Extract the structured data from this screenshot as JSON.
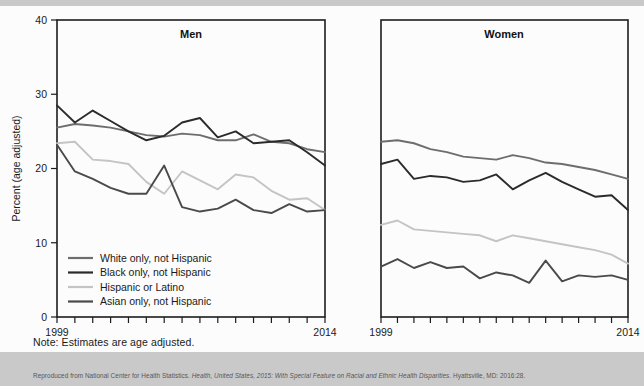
{
  "figure": {
    "note": "Note: Estimates are age adjusted.",
    "citation_prefix": "Reproduced from National Center for Health Statistics. ",
    "citation_italic": "Health, United States, 2015: With Special Feature on Racial and Ethnic Health Disparities",
    "citation_suffix": ". Hyattsville, MD: 2016:28."
  },
  "chart_data": {
    "type": "line",
    "title": "",
    "ylabel": "Percent (age adjusted)",
    "xlabel": "",
    "ylim": [
      0,
      40
    ],
    "yticks": [
      0,
      10,
      20,
      30,
      40
    ],
    "ytick_labels": [
      "0",
      "10",
      "20",
      "30",
      "40"
    ],
    "xlim": [
      1999,
      2014
    ],
    "x": [
      1999,
      2000,
      2001,
      2002,
      2003,
      2004,
      2005,
      2006,
      2007,
      2008,
      2009,
      2010,
      2011,
      2012,
      2013,
      2014
    ],
    "xtick_labels_shown": [
      "1999",
      "2014"
    ],
    "grid": false,
    "legend_position": "lower-left-inside-men-panel",
    "panels": [
      {
        "label": "Men",
        "series": [
          {
            "name": "White only, not Hispanic",
            "color": "#6d6d6d",
            "values": [
              25.5,
              26.0,
              25.8,
              25.5,
              25.0,
              24.5,
              24.3,
              24.7,
              24.5,
              23.8,
              23.8,
              24.6,
              23.6,
              23.4,
              22.6,
              22.2
            ]
          },
          {
            "name": "Black only, not Hispanic",
            "color": "#2b2b2b",
            "values": [
              28.5,
              26.2,
              27.8,
              26.4,
              25.0,
              23.8,
              24.4,
              26.2,
              26.8,
              24.2,
              25.0,
              23.4,
              23.6,
              23.8,
              22.2,
              20.4
            ]
          },
          {
            "name": "Hispanic or Latino",
            "color": "#c4c4c4",
            "values": [
              23.4,
              23.6,
              21.2,
              21.0,
              20.6,
              18.2,
              16.6,
              19.6,
              18.4,
              17.2,
              19.2,
              18.8,
              17.0,
              15.8,
              16.0,
              14.4
            ]
          },
          {
            "name": "Asian only, not Hispanic",
            "color": "#4a4a4a",
            "values": [
              23.2,
              19.6,
              18.6,
              17.4,
              16.6,
              16.6,
              20.4,
              14.8,
              14.2,
              14.6,
              15.8,
              14.4,
              14.0,
              15.2,
              14.2,
              14.4
            ]
          }
        ]
      },
      {
        "label": "Women",
        "series": [
          {
            "name": "White only, not Hispanic",
            "color": "#6d6d6d",
            "values": [
              23.6,
              23.8,
              23.4,
              22.6,
              22.2,
              21.6,
              21.4,
              21.2,
              21.8,
              21.4,
              20.8,
              20.6,
              20.2,
              19.8,
              19.2,
              18.6
            ]
          },
          {
            "name": "Black only, not Hispanic",
            "color": "#2b2b2b",
            "values": [
              20.6,
              21.2,
              18.6,
              19.0,
              18.8,
              18.2,
              18.4,
              19.2,
              17.2,
              18.4,
              19.4,
              18.2,
              17.2,
              16.2,
              16.4,
              14.4
            ]
          },
          {
            "name": "Hispanic or Latino",
            "color": "#c4c4c4",
            "values": [
              12.4,
              13.0,
              11.8,
              11.6,
              11.4,
              11.2,
              11.0,
              10.2,
              11.0,
              10.6,
              10.2,
              9.8,
              9.4,
              9.0,
              8.4,
              7.2
            ]
          },
          {
            "name": "Asian only, not Hispanic",
            "color": "#4a4a4a",
            "values": [
              6.8,
              7.8,
              6.6,
              7.4,
              6.6,
              6.8,
              5.2,
              6.0,
              5.6,
              4.6,
              7.6,
              4.8,
              5.6,
              5.4,
              5.6,
              5.0
            ]
          }
        ]
      }
    ],
    "legend": [
      {
        "label": "White only, not Hispanic",
        "color": "#6d6d6d"
      },
      {
        "label": "Black only, not Hispanic",
        "color": "#2b2b2b"
      },
      {
        "label": "Hispanic or Latino",
        "color": "#c4c4c4"
      },
      {
        "label": "Asian only, not Hispanic",
        "color": "#4a4a4a"
      }
    ]
  }
}
